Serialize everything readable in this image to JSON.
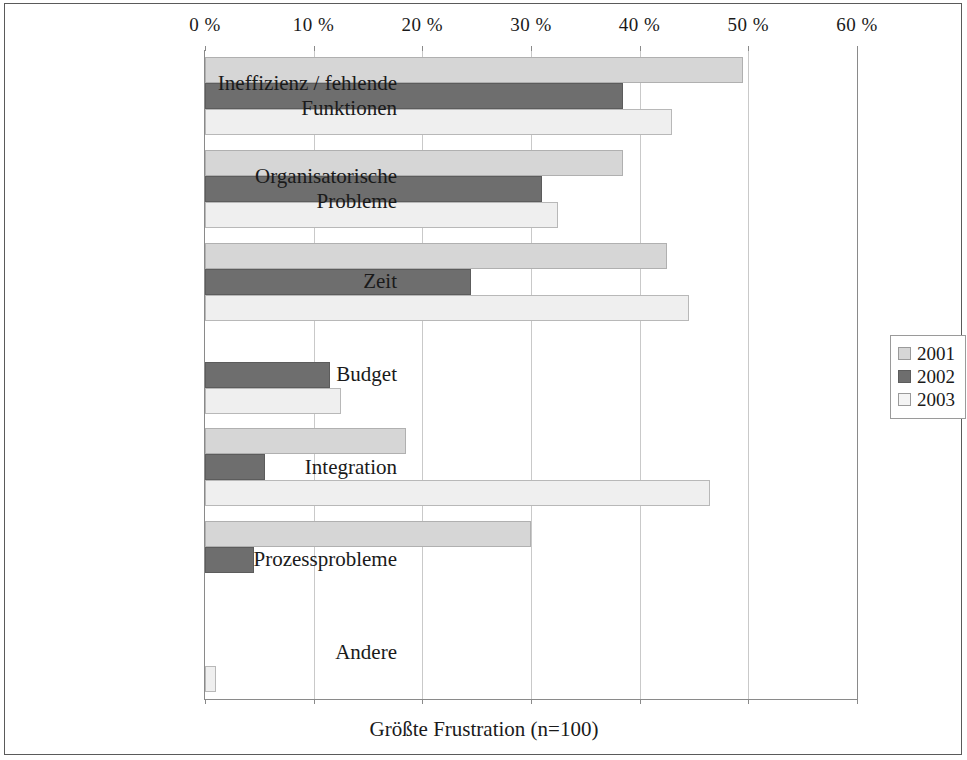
{
  "chart_data": {
    "type": "bar",
    "orientation": "horizontal",
    "title": "",
    "xlabel": "Größte Frustration (n=100)",
    "ylabel": "",
    "xlim": [
      0,
      60
    ],
    "xticks": [
      0,
      10,
      20,
      30,
      40,
      50,
      60
    ],
    "xtick_labels": [
      "0 %",
      "10 %",
      "20 %",
      "30 %",
      "40 %",
      "50 %",
      "60 %"
    ],
    "grid": true,
    "legend_position": "right",
    "categories": [
      "Ineffizienz / fehlende\nFunktionen",
      "Organisatorische\nProbleme",
      "Zeit",
      "Budget",
      "Integration",
      "Prozessprobleme",
      "Andere"
    ],
    "series": [
      {
        "name": "2001",
        "color": "#d6d6d6",
        "values": [
          49.5,
          38.5,
          42.5,
          0,
          18.5,
          30,
          0
        ]
      },
      {
        "name": "2002",
        "color": "#6e6e6e",
        "values": [
          38.5,
          31,
          24.5,
          11.5,
          5.5,
          4.5,
          0
        ]
      },
      {
        "name": "2003",
        "color": "#efefef",
        "values": [
          43,
          32.5,
          44.5,
          12.5,
          46.5,
          0,
          1
        ]
      }
    ]
  },
  "legend": {
    "entries": [
      "2001",
      "2002",
      "2003"
    ]
  },
  "axis": {
    "x_title": "Größte Frustration (n=100)"
  }
}
